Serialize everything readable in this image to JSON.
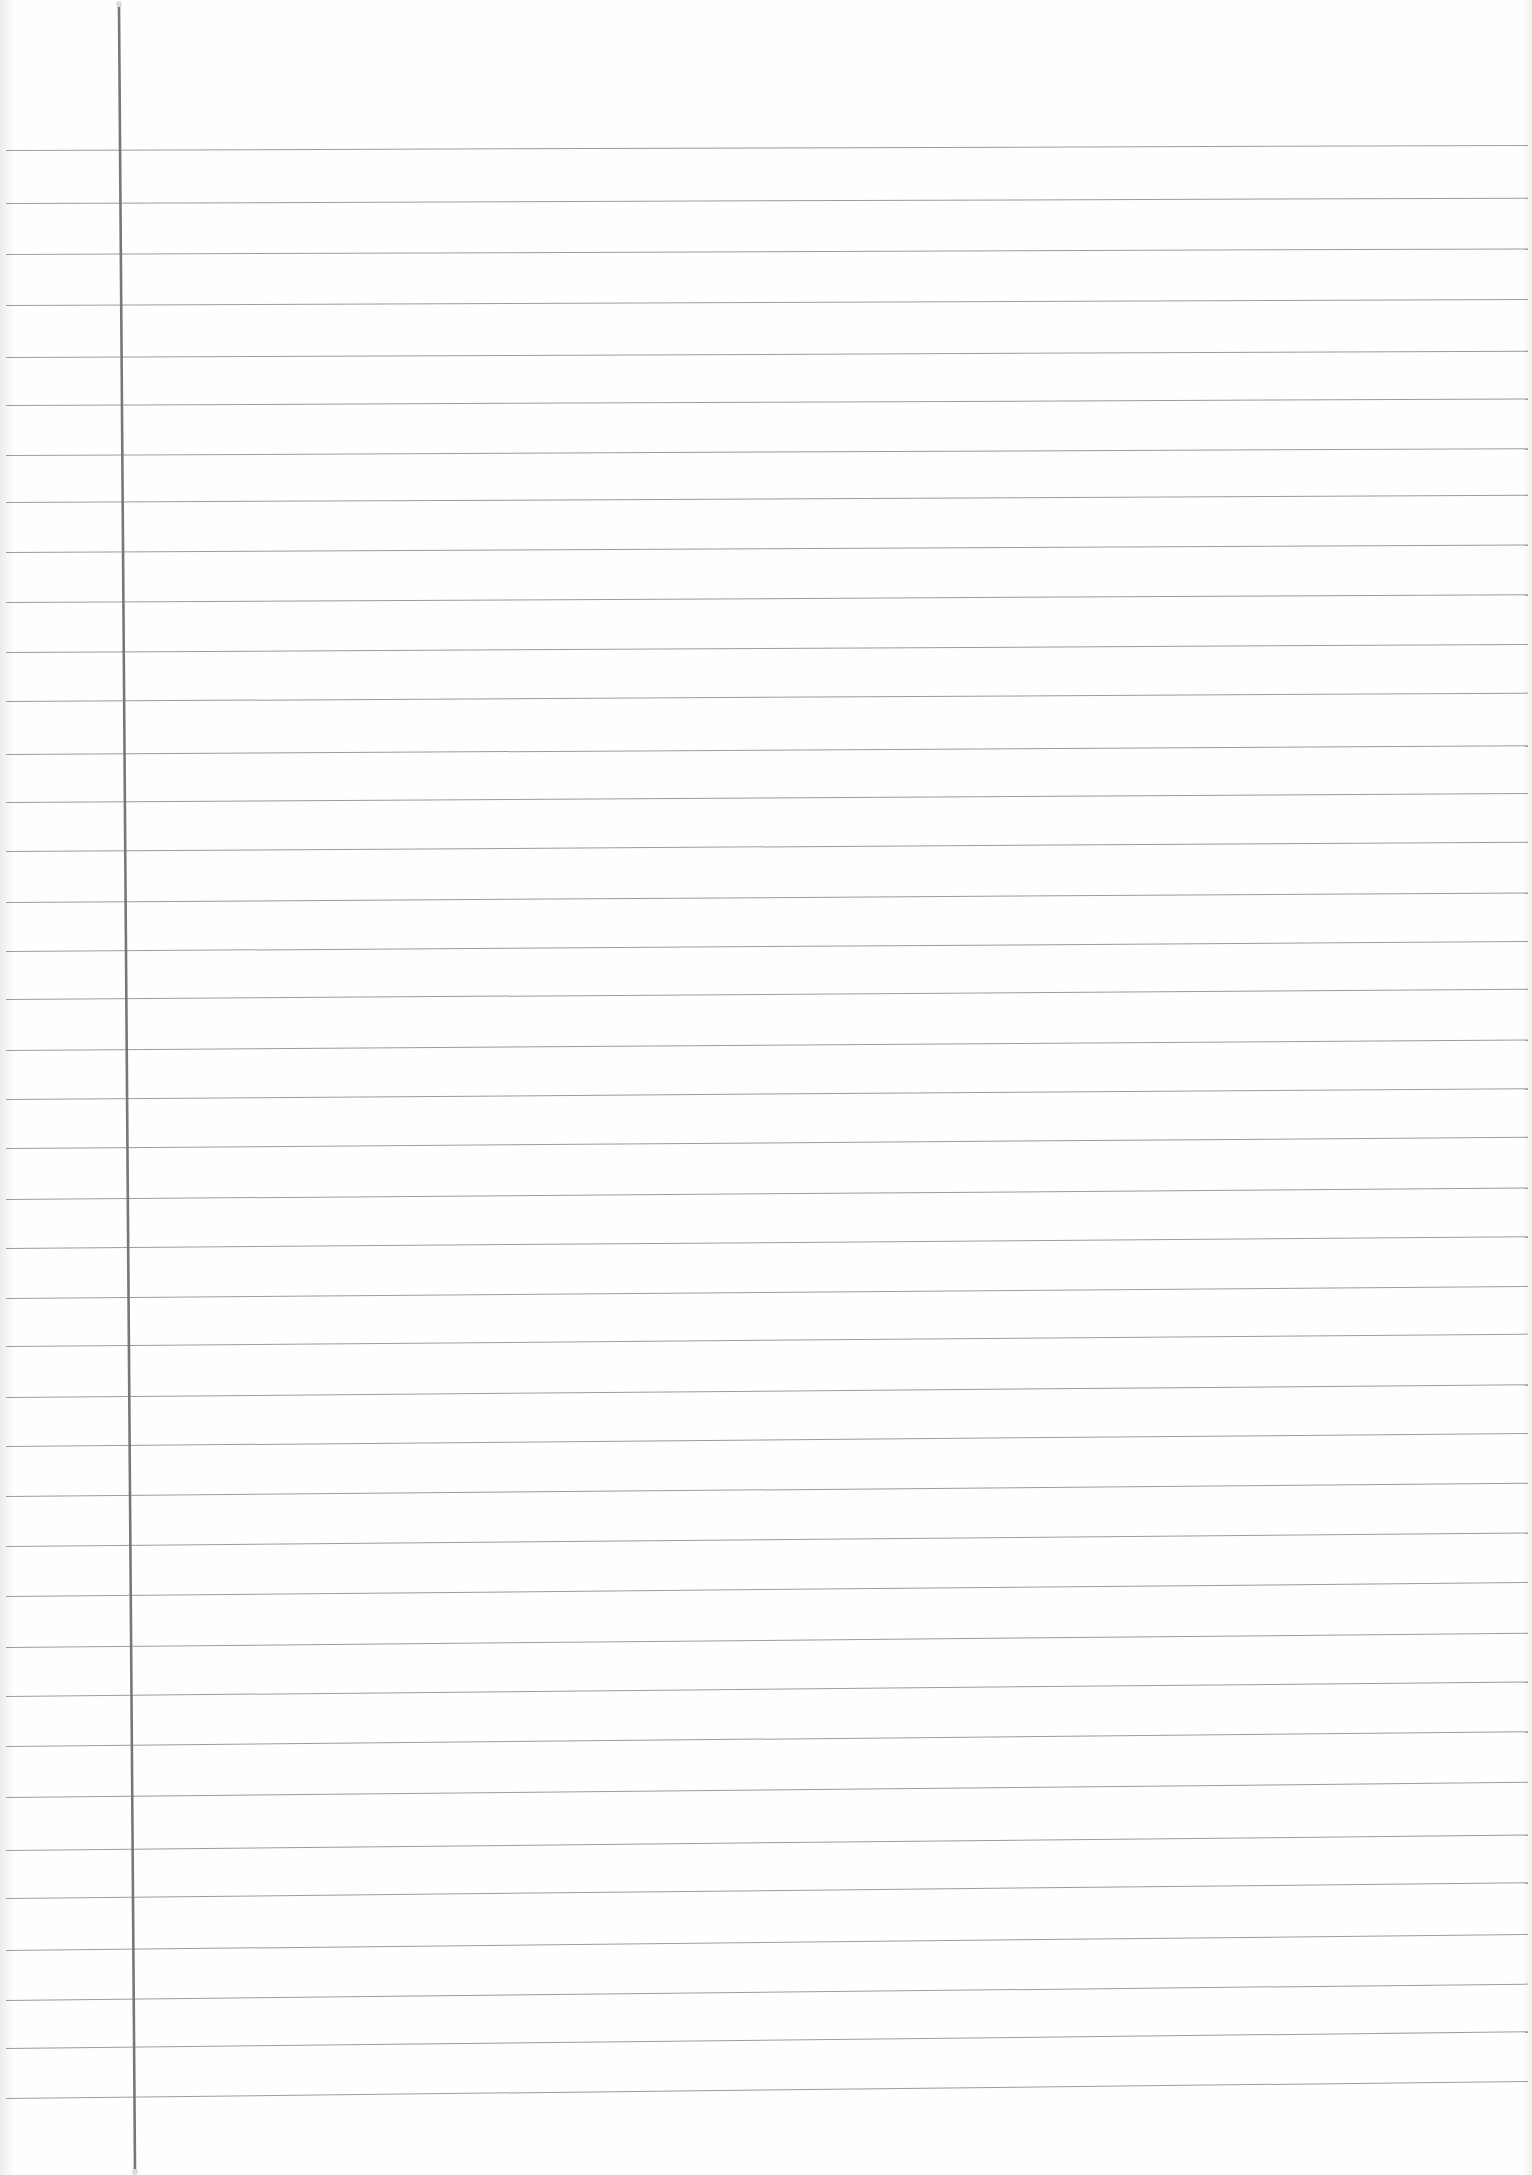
{
  "document": {
    "type": "ruled-notebook-page",
    "content_text": "",
    "colors": {
      "paper": "#fefefe",
      "rule_line": "#9c9c9c",
      "margin_line": "#777777"
    },
    "margin_line": {
      "x_top": 119,
      "x_bottom": 135,
      "y_top": 6,
      "y_bottom": 2170
    },
    "rule_line_count": 40,
    "rule_line_spacing_px": 50,
    "rule_lines_left_y": [
      150,
      203,
      254,
      305,
      357,
      405,
      455,
      502,
      552,
      602,
      652,
      701,
      754,
      802,
      851,
      902,
      951,
      999,
      1050,
      1099,
      1148,
      1199,
      1248,
      1298,
      1346,
      1397,
      1446,
      1496,
      1546,
      1596,
      1647,
      1696,
      1746,
      1797,
      1850,
      1898,
      1950,
      2000,
      2048,
      2098
    ],
    "rule_tilt_px_top": 5,
    "rule_tilt_px_bottom": 17,
    "bleed_through_marks": [
      {
        "x": 545,
        "y": 167,
        "text": ""
      },
      {
        "x": 895,
        "y": 162,
        "text": ""
      }
    ]
  }
}
